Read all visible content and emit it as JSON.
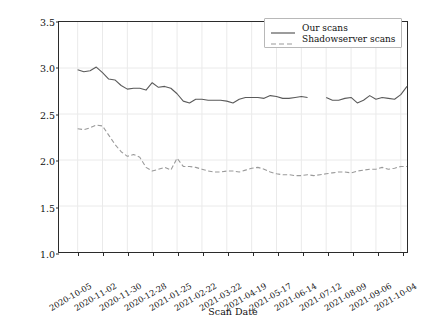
{
  "chart_data": {
    "type": "line",
    "title": "",
    "xlabel": "Scan Date",
    "ylabel": "Count of Open DNS Resolvers (in Millions)",
    "ylim": [
      1.0,
      3.5
    ],
    "ytick_labels": [
      "1.0",
      "1.5",
      "2.0",
      "2.5",
      "3.0",
      "3.5"
    ],
    "ytick_values": [
      1.0,
      1.5,
      2.0,
      2.5,
      3.0,
      3.5
    ],
    "xtick_labels": [
      "2020-10-05",
      "2020-11-02",
      "2020-11-30",
      "2020-12-28",
      "2021-01-25",
      "2021-02-22",
      "2021-03-22",
      "2021-04-19",
      "2021-05-17",
      "2021-06-14",
      "2021-07-12",
      "2021-08-09",
      "2021-09-06",
      "2021-10-04"
    ],
    "xtick_positions": [
      3,
      7,
      11,
      15,
      19,
      23,
      27,
      31,
      35,
      39,
      43,
      47,
      51,
      55
    ],
    "x_index_range": [
      0,
      56
    ],
    "grid": true,
    "legend_position": "upper right",
    "legend": [
      "Our scans",
      "Shadowserver scans"
    ],
    "series": [
      {
        "name": "Our scans",
        "style": "solid",
        "color": "#5a5a5a",
        "x": [
          3,
          4,
          5,
          6,
          7,
          8,
          9,
          10,
          11,
          12,
          13,
          14,
          15,
          16,
          17,
          18,
          19,
          20,
          21,
          22,
          23,
          24,
          25,
          26,
          27,
          28,
          29,
          30,
          31,
          32,
          33,
          34,
          35,
          36,
          37,
          38,
          39,
          40,
          43,
          44,
          45,
          46,
          47,
          48,
          49,
          50,
          51,
          52,
          53,
          54,
          55,
          56
        ],
        "values": [
          2.98,
          2.96,
          2.97,
          3.01,
          2.95,
          2.88,
          2.87,
          2.81,
          2.77,
          2.78,
          2.78,
          2.76,
          2.84,
          2.79,
          2.8,
          2.78,
          2.72,
          2.64,
          2.62,
          2.66,
          2.66,
          2.65,
          2.65,
          2.65,
          2.64,
          2.62,
          2.66,
          2.68,
          2.68,
          2.68,
          2.67,
          2.7,
          2.69,
          2.67,
          2.67,
          2.68,
          2.69,
          2.68,
          2.68,
          2.65,
          2.65,
          2.67,
          2.68,
          2.62,
          2.65,
          2.7,
          2.66,
          2.68,
          2.67,
          2.66,
          2.71,
          2.8
        ]
      },
      {
        "name": "Shadowserver scans",
        "style": "dashed",
        "color": "#9a9a9a",
        "x": [
          3,
          4,
          5,
          6,
          7,
          8,
          9,
          10,
          11,
          12,
          13,
          14,
          15,
          16,
          17,
          18,
          19,
          20,
          21,
          22,
          23,
          24,
          25,
          26,
          27,
          28,
          29,
          30,
          31,
          32,
          33,
          34,
          35,
          36,
          37,
          38,
          39,
          40,
          41,
          42,
          43,
          44,
          45,
          46,
          47,
          48,
          49,
          50,
          51,
          52,
          53,
          54,
          55,
          56
        ],
        "values": [
          2.34,
          2.33,
          2.35,
          2.38,
          2.37,
          2.27,
          2.17,
          2.09,
          2.04,
          2.06,
          2.03,
          1.92,
          1.88,
          1.9,
          1.92,
          1.89,
          2.02,
          1.93,
          1.93,
          1.92,
          1.9,
          1.88,
          1.87,
          1.87,
          1.88,
          1.88,
          1.87,
          1.89,
          1.91,
          1.92,
          1.9,
          1.87,
          1.85,
          1.84,
          1.84,
          1.83,
          1.83,
          1.84,
          1.83,
          1.84,
          1.85,
          1.86,
          1.87,
          1.87,
          1.86,
          1.88,
          1.89,
          1.9,
          1.9,
          1.92,
          1.9,
          1.91,
          1.93,
          1.93
        ]
      }
    ]
  },
  "legend": {
    "items": [
      {
        "label": "Our scans",
        "style": "solid"
      },
      {
        "label": "Shadowserver scans",
        "style": "dashed"
      }
    ]
  }
}
